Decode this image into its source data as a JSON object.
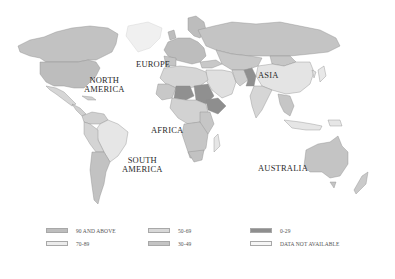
{
  "map": {
    "labels": {
      "north_america": "NORTH\nAMERICA",
      "north_america_line1": "NORTH",
      "north_america_line2": "AMERICA",
      "europe": "EUROPE",
      "asia": "ASIA",
      "africa": "AFRICA",
      "south_america_line1": "SOUTH",
      "south_america_line2": "AMERICA",
      "australia": "AUSTRALIA"
    },
    "colors": {
      "c90": "#bdbdbd",
      "c70": "#e4e4e4",
      "c50": "#d2d2d2",
      "c30": "#c6c6c6",
      "c0": "#8e8e8e",
      "na": "#f1f1f1",
      "border": "#7a7a7a",
      "ocean": "#ffffff"
    }
  },
  "legend": {
    "items": [
      {
        "label": "90 AND ABOVE",
        "color": "#bdbdbd"
      },
      {
        "label": "70-89",
        "color": "#ececec"
      },
      {
        "label": "50-69",
        "color": "#d8d8d8"
      },
      {
        "label": "30-49",
        "color": "#c4c4c4"
      },
      {
        "label": "0-29",
        "color": "#8e8e8e"
      },
      {
        "label": "DATA NOT AVAILABLE",
        "color": "#f6f6f6"
      }
    ]
  }
}
